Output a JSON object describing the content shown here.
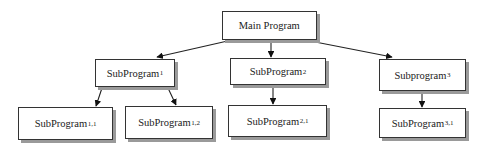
{
  "diagram": {
    "type": "hierarchy-chart",
    "nodes": [
      {
        "id": "main",
        "label": "Main Program",
        "sub": "",
        "x": 222,
        "y": 11,
        "w": 95,
        "h": 29
      },
      {
        "id": "sp1",
        "label": "SubProgram",
        "sub": "1",
        "x": 95,
        "y": 59,
        "w": 80,
        "h": 28
      },
      {
        "id": "sp2",
        "label": "SubProgram",
        "sub": "2",
        "x": 230,
        "y": 58,
        "w": 96,
        "h": 27
      },
      {
        "id": "sp3",
        "label": "Subprogram",
        "sub": "3",
        "x": 379,
        "y": 59,
        "w": 87,
        "h": 32
      },
      {
        "id": "sp11",
        "label": "SubProgram",
        "sub": "1,1",
        "x": 18,
        "y": 107,
        "w": 95,
        "h": 33
      },
      {
        "id": "sp12",
        "label": "SubProgram",
        "sub": "1,2",
        "x": 125,
        "y": 106,
        "w": 88,
        "h": 33
      },
      {
        "id": "sp21",
        "label": "SubProgram",
        "sub": "2,1",
        "x": 228,
        "y": 105,
        "w": 99,
        "h": 32
      },
      {
        "id": "sp31",
        "label": "SubProgram",
        "sub": "3,1",
        "x": 379,
        "y": 108,
        "w": 87,
        "h": 30
      }
    ],
    "edges": [
      {
        "from": "main",
        "to": "sp1",
        "x1": 232,
        "y1": 40,
        "x2": 157,
        "y2": 57
      },
      {
        "from": "main",
        "to": "sp2",
        "x1": 271,
        "y1": 40,
        "x2": 271,
        "y2": 57
      },
      {
        "from": "main",
        "to": "sp3",
        "x1": 305,
        "y1": 40,
        "x2": 392,
        "y2": 57
      },
      {
        "from": "sp1",
        "to": "sp11",
        "x1": 102,
        "y1": 88,
        "x2": 96,
        "y2": 106
      },
      {
        "from": "sp1",
        "to": "sp12",
        "x1": 168,
        "y1": 88,
        "x2": 176,
        "y2": 105
      },
      {
        "from": "sp2",
        "to": "sp21",
        "x1": 273,
        "y1": 86,
        "x2": 273,
        "y2": 104
      },
      {
        "from": "sp3",
        "to": "sp31",
        "x1": 422,
        "y1": 92,
        "x2": 422,
        "y2": 107
      }
    ]
  }
}
